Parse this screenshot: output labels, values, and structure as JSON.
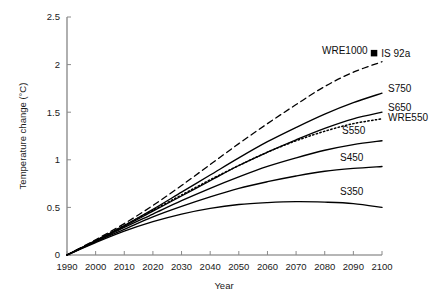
{
  "chart_data": {
    "type": "line",
    "title": "",
    "xlabel": "Year",
    "ylabel": "Temperature change (°C)",
    "xlim": [
      1990,
      2100
    ],
    "ylim": [
      0,
      2.5
    ],
    "grid": false,
    "legend_position": "inline-right-of-curve-ends",
    "x_ticks": [
      1990,
      2000,
      2010,
      2020,
      2030,
      2040,
      2050,
      2060,
      2070,
      2080,
      2090,
      2100
    ],
    "x_tick_labels": [
      "1990",
      "2000",
      "2010",
      "2020",
      "2030",
      "2040",
      "2050",
      "2060",
      "2070",
      "2080",
      "2090",
      "2100"
    ],
    "y_ticks": [
      0,
      0.5,
      1,
      1.5,
      2,
      2.5
    ],
    "y_tick_labels": [
      "0",
      "0.5",
      "1",
      "1.5",
      "2",
      "2.5"
    ],
    "x": [
      1990,
      2000,
      2010,
      2020,
      2030,
      2040,
      2050,
      2060,
      2070,
      2080,
      2090,
      2100
    ],
    "series": [
      {
        "name": "WRE1000",
        "label": "WRE1000",
        "style": "dashed",
        "color": "#000000",
        "values": [
          0.0,
          0.16,
          0.33,
          0.52,
          0.73,
          0.95,
          1.17,
          1.38,
          1.58,
          1.77,
          1.92,
          2.03
        ]
      },
      {
        "name": "S750",
        "label": "S750",
        "style": "solid",
        "color": "#000000",
        "values": [
          0.0,
          0.15,
          0.31,
          0.48,
          0.66,
          0.84,
          1.02,
          1.19,
          1.34,
          1.48,
          1.6,
          1.7
        ]
      },
      {
        "name": "S650",
        "label": "S650",
        "style": "solid",
        "color": "#000000",
        "values": [
          0.0,
          0.15,
          0.3,
          0.46,
          0.62,
          0.78,
          0.94,
          1.08,
          1.21,
          1.33,
          1.43,
          1.5
        ]
      },
      {
        "name": "WRE550",
        "label": "WRE550",
        "style": "dotted",
        "color": "#000000",
        "values": [
          0.0,
          0.15,
          0.31,
          0.47,
          0.63,
          0.79,
          0.94,
          1.08,
          1.2,
          1.3,
          1.38,
          1.43
        ]
      },
      {
        "name": "S550",
        "label": "S550",
        "style": "solid",
        "color": "#000000",
        "values": [
          0.0,
          0.14,
          0.29,
          0.43,
          0.57,
          0.7,
          0.82,
          0.93,
          1.02,
          1.1,
          1.16,
          1.2
        ]
      },
      {
        "name": "S450",
        "label": "S450",
        "style": "solid",
        "color": "#000000",
        "values": [
          0.0,
          0.14,
          0.27,
          0.4,
          0.51,
          0.61,
          0.7,
          0.77,
          0.83,
          0.88,
          0.91,
          0.93
        ]
      },
      {
        "name": "S350",
        "label": "S350",
        "style": "solid",
        "color": "#000000",
        "values": [
          0.0,
          0.13,
          0.25,
          0.35,
          0.43,
          0.49,
          0.53,
          0.55,
          0.56,
          0.555,
          0.54,
          0.5
        ]
      }
    ],
    "markers": [
      {
        "name": "IS 92a",
        "label": "IS 92a",
        "shape": "filled-square",
        "color": "#000000",
        "x": 2100,
        "y": 2.12
      }
    ],
    "annotations": [
      {
        "name": "WRE1000",
        "text": "WRE1000"
      },
      {
        "name": "IS 92a",
        "text": "IS 92a"
      },
      {
        "name": "S750",
        "text": "S750"
      },
      {
        "name": "S650",
        "text": "S650"
      },
      {
        "name": "WRE550",
        "text": "WRE550"
      },
      {
        "name": "S550",
        "text": "S550"
      },
      {
        "name": "S450",
        "text": "S450"
      },
      {
        "name": "S350",
        "text": "S350"
      }
    ]
  }
}
